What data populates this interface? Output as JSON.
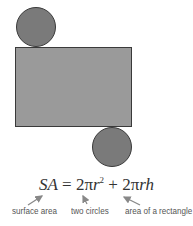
{
  "figure": {
    "colors": {
      "circle_fill": "#7a7a7a",
      "rect_fill": "#9a9a9a",
      "outline": "#3a3a3a",
      "text": "#333333",
      "label_text": "#555555",
      "arrow": "#888888"
    },
    "shapes": {
      "top_circle": {
        "cx": 36,
        "cy": 27,
        "r": 20
      },
      "rectangle": {
        "x": 15,
        "y": 47,
        "width": 117,
        "height": 80
      },
      "bottom_circle": {
        "cx": 112,
        "cy": 147,
        "r": 20
      }
    }
  },
  "formula": {
    "lhs": "SA",
    "equals": "=",
    "term1_coef": "2π",
    "term1_var": "r",
    "term1_exp": "2",
    "plus": "+",
    "term2_coef": "2π",
    "term2_var": "rh"
  },
  "labels": [
    {
      "text": "surface area",
      "x": 12
    },
    {
      "text": "two circles",
      "x": 71
    },
    {
      "text": "area of a rectangle",
      "x": 125
    }
  ]
}
